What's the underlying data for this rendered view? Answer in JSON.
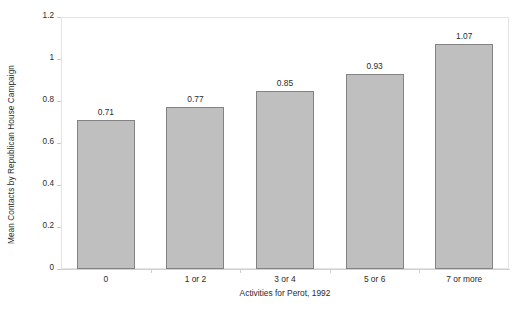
{
  "chart_data": {
    "type": "bar",
    "title": "",
    "subtitle": "",
    "xlabel": "Activities for Perot, 1992",
    "ylabel": "Mean Contacts by Republican House Campaign",
    "categories": [
      "0",
      "1 or 2",
      "3 or 4",
      "5 or 6",
      "7 or more"
    ],
    "values": [
      0.71,
      0.77,
      0.85,
      0.93,
      1.07
    ],
    "data_labels": [
      "0.71",
      "0.77",
      "0.85",
      "0.93",
      "1.07"
    ],
    "ylim": [
      0,
      1.2
    ],
    "ytick_values": [
      0,
      0.2,
      0.4,
      0.6,
      0.8,
      1.0,
      1.2
    ],
    "ytick_labels": [
      "0",
      "0.2",
      "0.4",
      "0.6",
      "0.8",
      "1",
      "1.2"
    ],
    "grid": false,
    "legend": null,
    "legend_position": "none",
    "series": [
      {
        "name": "Mean Contacts by Republican House Campaign",
        "values": [
          0.71,
          0.77,
          0.85,
          0.93,
          1.07
        ]
      }
    ],
    "colors": {
      "bar_fill": "#bfbfbf",
      "bar_border": "#838383",
      "plot_border": "#e4e4e4",
      "axis_line": "#d0d0d0",
      "text": "#2b2b2b",
      "background": "#ffffff"
    }
  }
}
